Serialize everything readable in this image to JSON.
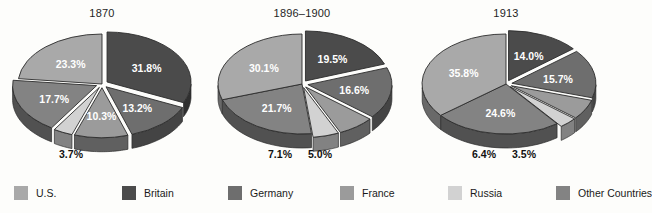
{
  "figure": {
    "background": "#fdfdfb",
    "label_text_color": "#111111",
    "slice_label_color": "#ffffff"
  },
  "legend": {
    "name": "series-legend",
    "items": [
      {
        "label": "U.S.",
        "key": "us",
        "color": "#a9a9a9"
      },
      {
        "label": "Britain",
        "key": "uk",
        "color": "#4b4b4b"
      },
      {
        "label": "Germany",
        "key": "de",
        "color": "#6e6e6e"
      },
      {
        "label": "France",
        "key": "fr",
        "color": "#9b9b9b"
      },
      {
        "label": "Russia",
        "key": "ru",
        "color": "#d2d2d2"
      },
      {
        "label": "Other Countries",
        "key": "other",
        "color": "#838383"
      }
    ]
  },
  "chart_data": {
    "type": "pie",
    "title": "",
    "subtitle": "",
    "xlabel": "",
    "ylabel": "",
    "legend_position": "bottom",
    "grid": false,
    "value_suffix": "%",
    "categories": [
      "Britain",
      "Germany",
      "France",
      "Russia",
      "Other Countries",
      "U.S."
    ],
    "charts": [
      {
        "title": "1870",
        "panel": "left",
        "slices": [
          {
            "name": "Britain",
            "key": "uk",
            "value": 31.8,
            "label": "31.8%",
            "color": "#4b4b4b",
            "label_placement": "inside",
            "exploded": true
          },
          {
            "name": "Germany",
            "key": "de",
            "value": 13.2,
            "label": "13.2%",
            "color": "#6e6e6e",
            "label_placement": "inside",
            "exploded": true
          },
          {
            "name": "France",
            "key": "fr",
            "value": 10.3,
            "label": "10.3%",
            "color": "#9b9b9b",
            "label_placement": "inside",
            "exploded": true
          },
          {
            "name": "Russia",
            "key": "ru",
            "value": 3.7,
            "label": "3.7%",
            "color": "#d2d2d2",
            "label_placement": "outside",
            "exploded": true
          },
          {
            "name": "Other Countries",
            "key": "other",
            "value": 17.7,
            "label": "17.7%",
            "color": "#838383",
            "label_placement": "inside",
            "exploded": true
          },
          {
            "name": "U.S.",
            "key": "us",
            "value": 23.3,
            "label": "23.3%",
            "color": "#a9a9a9",
            "label_placement": "inside",
            "exploded": false
          }
        ]
      },
      {
        "title": "1896–1900",
        "panel": "center",
        "slices": [
          {
            "name": "Britain",
            "key": "uk",
            "value": 19.5,
            "label": "19.5%",
            "color": "#4b4b4b",
            "label_placement": "inside",
            "exploded": true
          },
          {
            "name": "Germany",
            "key": "de",
            "value": 16.6,
            "label": "16.6%",
            "color": "#6e6e6e",
            "label_placement": "inside",
            "exploded": true
          },
          {
            "name": "France",
            "key": "fr",
            "value": 7.1,
            "label": "7.1%",
            "color": "#9b9b9b",
            "label_placement": "outside",
            "exploded": true
          },
          {
            "name": "Russia",
            "key": "ru",
            "value": 5.0,
            "label": "5.0%",
            "color": "#d2d2d2",
            "label_placement": "outside",
            "exploded": true
          },
          {
            "name": "Other Countries",
            "key": "other",
            "value": 21.7,
            "label": "21.7%",
            "color": "#838383",
            "label_placement": "inside",
            "exploded": false
          },
          {
            "name": "U.S.",
            "key": "us",
            "value": 30.1,
            "label": "30.1%",
            "color": "#a9a9a9",
            "label_placement": "inside",
            "exploded": false
          }
        ]
      },
      {
        "title": "1913",
        "panel": "right",
        "slices": [
          {
            "name": "Britain",
            "key": "uk",
            "value": 14.0,
            "label": "14.0%",
            "color": "#4b4b4b",
            "label_placement": "inside",
            "exploded": true
          },
          {
            "name": "Germany",
            "key": "de",
            "value": 15.7,
            "label": "15.7%",
            "color": "#6e6e6e",
            "label_placement": "inside",
            "exploded": true
          },
          {
            "name": "France",
            "key": "fr",
            "value": 6.4,
            "label": "6.4%",
            "color": "#9b9b9b",
            "label_placement": "outside",
            "exploded": true
          },
          {
            "name": "Russia",
            "key": "ru",
            "value": 3.5,
            "label": "3.5%",
            "color": "#d2d2d2",
            "label_placement": "outside",
            "exploded": true
          },
          {
            "name": "Other Countries",
            "key": "other",
            "value": 24.6,
            "label": "24.6%",
            "color": "#838383",
            "label_placement": "inside",
            "exploded": false
          },
          {
            "name": "U.S.",
            "key": "us",
            "value": 35.8,
            "label": "35.8%",
            "color": "#a9a9a9",
            "label_placement": "inside",
            "exploded": false
          }
        ]
      }
    ]
  }
}
